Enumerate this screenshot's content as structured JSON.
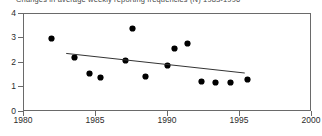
{
  "chart_data": {
    "type": "scatter",
    "title": "Changes in average weekly reporting frequencies (N) 1983-1996",
    "xlabel": "",
    "ylabel": "",
    "xlim": [
      1980,
      2000
    ],
    "ylim": [
      0,
      4
    ],
    "xticks": [
      "1980",
      "1985",
      "1990",
      "1995",
      "2000"
    ],
    "xtick_values": [
      1980,
      1985,
      1990,
      1995,
      2000
    ],
    "yticks": [
      "0",
      "1",
      "2",
      "3",
      "4"
    ],
    "ytick_values": [
      0,
      1,
      2,
      3,
      4
    ],
    "grid": false,
    "legend": false,
    "marker_color": "#000000",
    "trendline_color": "#333333",
    "axis_color": "#6a6a6a",
    "points": [
      {
        "x": 1982.0,
        "y": 2.95
      },
      {
        "x": 1983.6,
        "y": 2.2
      },
      {
        "x": 1984.6,
        "y": 1.55
      },
      {
        "x": 1985.4,
        "y": 1.35
      },
      {
        "x": 1987.6,
        "y": 3.35
      },
      {
        "x": 1987.1,
        "y": 2.05
      },
      {
        "x": 1988.5,
        "y": 1.4
      },
      {
        "x": 1990.5,
        "y": 2.55
      },
      {
        "x": 1991.4,
        "y": 2.75
      },
      {
        "x": 1990.0,
        "y": 1.85
      },
      {
        "x": 1992.4,
        "y": 1.2
      },
      {
        "x": 1993.4,
        "y": 1.15
      },
      {
        "x": 1994.4,
        "y": 1.15
      },
      {
        "x": 1995.6,
        "y": 1.3
      }
    ],
    "trendline": {
      "x_start": 1983.0,
      "y_start": 2.35,
      "x_end": 1995.4,
      "y_end": 1.55
    }
  }
}
